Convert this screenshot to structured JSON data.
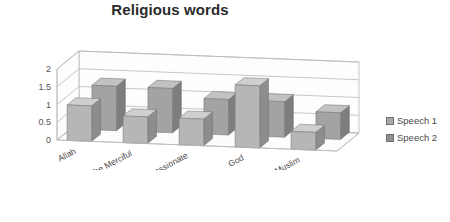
{
  "chart_data": {
    "type": "bar",
    "title": "Religious words",
    "xlabel": "",
    "ylabel": "",
    "ylim": [
      0,
      2
    ],
    "yticks": [
      "0",
      "0.5",
      "1",
      "1.5",
      "2"
    ],
    "grid": true,
    "three_d": true,
    "legend_position": "right",
    "categories": [
      "Allah",
      "The Merciful",
      "The Compassionate",
      "God",
      "Muslim"
    ],
    "series": [
      {
        "name": "Speech 1",
        "values": [
          1,
          0.75,
          0.75,
          1.75,
          0.5
        ],
        "color": "#b3b3b3"
      },
      {
        "name": "Speech 2",
        "values": [
          1.25,
          1.25,
          1,
          1,
          0.75
        ],
        "color": "#9a9a9a"
      }
    ]
  },
  "legend": {
    "items": [
      {
        "label": "Speech 1",
        "color": "#a8a8a8"
      },
      {
        "label": "Speech 2",
        "color": "#8f8f8f"
      }
    ]
  },
  "colors": {
    "bar_front_s1": "#b6b6b6",
    "bar_side_s1": "#8d8d8d",
    "bar_top_s1": "#cfcfcf",
    "bar_front_s2": "#a3a3a3",
    "bar_side_s2": "#7e7e7e",
    "bar_top_s2": "#c2c2c2",
    "grid": "#b9b9b9",
    "text": "#4a4a4a",
    "title": "#2b2b2b"
  }
}
